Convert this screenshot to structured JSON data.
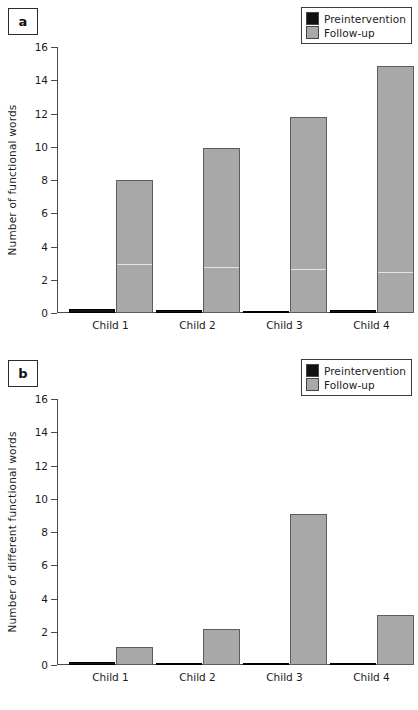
{
  "figure": {
    "panels": [
      {
        "tag": "a",
        "ylabel": "Number of functional words",
        "legend": [
          {
            "label": "Preintervention",
            "color": "#111111"
          },
          {
            "label": "Follow-up",
            "color": "#a8a8a8"
          }
        ],
        "chart_data": {
          "type": "bar",
          "title": "",
          "xlabel": "",
          "ylabel": "Number of functional words",
          "categories": [
            "Child 1",
            "Child 2",
            "Child 3",
            "Child 4"
          ],
          "ticks": [
            0,
            2,
            4,
            6,
            8,
            10,
            12,
            14,
            16
          ],
          "ylim": [
            0,
            16
          ],
          "grid": false,
          "legend_position": "top-right",
          "series": [
            {
              "name": "Preintervention",
              "color": "#111111",
              "values": [
                0.25,
                0.2,
                0.15,
                0.2
              ]
            },
            {
              "name": "Follow-up",
              "color": "#a8a8a8",
              "values": [
                8.0,
                9.95,
                11.8,
                14.85
              ]
            }
          ]
        }
      },
      {
        "tag": "b",
        "ylabel": "Number of different functional words",
        "legend": [
          {
            "label": "Preintervention",
            "color": "#111111"
          },
          {
            "label": "Follow-up",
            "color": "#a8a8a8"
          }
        ],
        "chart_data": {
          "type": "bar",
          "title": "",
          "xlabel": "",
          "ylabel": "Number of different functional words",
          "categories": [
            "Child 1",
            "Child 2",
            "Child 3",
            "Child 4"
          ],
          "ticks": [
            0,
            2,
            4,
            6,
            8,
            10,
            12,
            14,
            16
          ],
          "ylim": [
            0,
            16
          ],
          "grid": false,
          "legend_position": "top-right",
          "series": [
            {
              "name": "Preintervention",
              "color": "#111111",
              "values": [
                0.2,
                0.15,
                0.08,
                0.12
              ]
            },
            {
              "name": "Follow-up",
              "color": "#a8a8a8",
              "values": [
                1.1,
                2.15,
                9.1,
                3.0
              ]
            }
          ]
        }
      }
    ]
  }
}
